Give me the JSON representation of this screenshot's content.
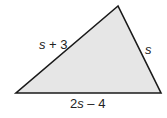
{
  "figure": {
    "type": "triangle",
    "fill_color": "#e6e6e6",
    "stroke_color": "#1a1a1a",
    "vertices": [
      [
        118,
        6
      ],
      [
        16,
        93
      ],
      [
        161,
        93
      ]
    ],
    "labels": {
      "left_side": {
        "var": "s",
        "rest": " + 3"
      },
      "right_side": {
        "var": "s"
      },
      "bottom_side": {
        "coef": "2",
        "var": "s",
        "rest": " – 4"
      }
    }
  }
}
